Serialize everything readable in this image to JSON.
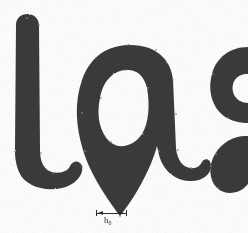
{
  "canvas": {
    "width": 248,
    "height": 233,
    "background_color": "#ffffff",
    "ink_color": "#3a3a3a",
    "anchor_color": "#8f8f8f",
    "annotation_color": "#2e2e2e"
  },
  "specimen": {
    "description": "Printed letterform specimen, brush / humanist sans style",
    "visible_text": "las",
    "glyphs": [
      {
        "name": "glyph-l",
        "character": "l",
        "description": "vertical stem with rounded top terminal and curved foot sweeping to the right",
        "clipped": false
      },
      {
        "name": "glyph-a",
        "character": "a",
        "description": "single-storey a with teardrop counter and pointed descending bottom terminal",
        "clipped": false
      },
      {
        "name": "glyph-s",
        "character": "s",
        "description": "partial s, cropped by the right edge of the frame",
        "clipped": true
      }
    ]
  },
  "annotation": {
    "name": "stem-width-measure",
    "type": "dimension-line",
    "label_base": "h",
    "label_subscript": "0",
    "label_full": "h0",
    "x_start": 96,
    "x_end": 126,
    "y": 213,
    "tick_height": 6,
    "label_x": 106,
    "label_y": 218
  }
}
